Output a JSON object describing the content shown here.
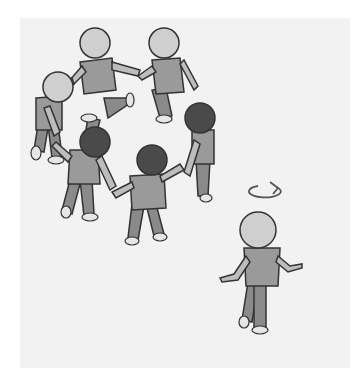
{
  "scene": {
    "description": "Illustration: seven children holding hands in a ring (circle game); one child walks away with a rotation arrow above head",
    "colors": {
      "background": "#ffffff",
      "panel": "#f2f2f2",
      "light_head": "#cfcfcf",
      "dark_head": "#4a4a4a",
      "shirt": "#9a9a9a",
      "pants": "#8a8a8a",
      "shoe": "#e6e6e6",
      "outline": "#333333",
      "arrow": "#555555"
    },
    "circle_children_count": 7,
    "light_headed": 3,
    "dark_headed": 3,
    "separate_child": "light-headed child walking toward bottom right with circular rotation arrow above",
    "text": ""
  }
}
